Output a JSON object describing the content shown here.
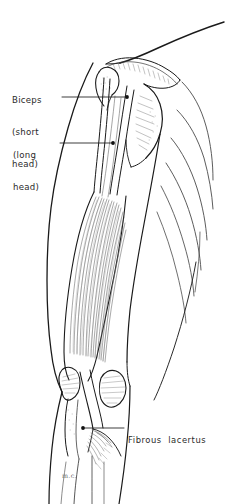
{
  "figure": {
    "style": "pen-and-ink line drawing",
    "background_color": "#ffffff",
    "ink_color": "#1a1a1a",
    "light_ink_color": "#6e6e6e",
    "width_px": 225,
    "height_px": 504
  },
  "labels": [
    {
      "id": "biceps-short-head",
      "lines": [
        "Biceps",
        "(short",
        "head)"
      ],
      "text": "Biceps (short head)",
      "line1": "Biceps",
      "line2": "(short",
      "line3": "head)",
      "leader": {
        "from_x": 62,
        "from_y": 97,
        "to_x": 127,
        "to_y": 97,
        "endpoint_marker": "dot"
      }
    },
    {
      "id": "biceps-long-head",
      "lines": [
        "(long",
        "head)"
      ],
      "text": "(long head)",
      "line1": "(long",
      "line2": "head)",
      "leader": {
        "from_x": 60,
        "from_y": 143,
        "to_x": 113,
        "to_y": 143,
        "endpoint_marker": "dot"
      }
    },
    {
      "id": "fibrous-lacertus",
      "lines": [
        "Fibrous  lacertus"
      ],
      "text": "Fibrous  lacertus",
      "line1": "Fibrous  lacertus",
      "leader": {
        "from_x": 124,
        "from_y": 428,
        "to_x": 83,
        "to_y": 428,
        "endpoint_marker": "dot"
      }
    }
  ],
  "signature": {
    "text": "m.c.",
    "x": 62,
    "y": 472
  },
  "regions": [
    {
      "name": "clavicle-and-shoulder-slope",
      "description": "upper contour sweeping from upper-right down to acromion"
    },
    {
      "name": "acromion-process",
      "description": "hatched bony prominence at top of shoulder"
    },
    {
      "name": "coracoid-process",
      "description": "hooked bony process medial to humeral head"
    },
    {
      "name": "humeral-head",
      "description": "rounded head of humerus in glenoid"
    },
    {
      "name": "biceps-tendons",
      "description": "two long parallel tendon cords descending from shoulder"
    },
    {
      "name": "biceps-muscle-belly",
      "description": "fusiform striated muscle belly of the arm"
    },
    {
      "name": "medial-epicondyle",
      "description": "bony prominence on medial side of elbow"
    },
    {
      "name": "lateral-epicondyle",
      "description": "hatched bony prominence on lateral side of elbow"
    },
    {
      "name": "biceps-distal-tendon",
      "description": "tendon crossing the cubital fossa"
    },
    {
      "name": "lacertus-fibrosus",
      "description": "fibrous expansion fanning medially across forearm flexors"
    },
    {
      "name": "forearm",
      "description": "proximal forearm outline below elbow"
    },
    {
      "name": "thorax-ribs",
      "description": "curved rib contour lines on the trunk at right"
    }
  ]
}
